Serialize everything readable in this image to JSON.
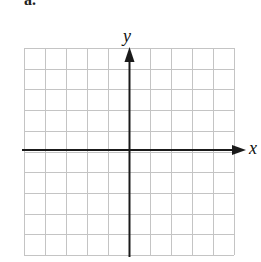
{
  "figure": {
    "partial_label": "a.",
    "grid": {
      "cols": 10,
      "rows": 10,
      "left": 24,
      "top": 48,
      "right": 234,
      "bottom": 255,
      "line_color": "#c4c4c4"
    },
    "axes": {
      "color": "#1a1a1a",
      "x_label": "x",
      "y_label": "y",
      "origin": {
        "x": 129,
        "y": 150
      }
    }
  }
}
